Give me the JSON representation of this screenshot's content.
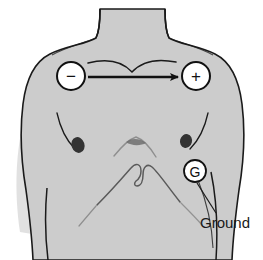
{
  "figure": {
    "background_color": "#ffffff",
    "body_fill_color": "#cccccc",
    "outline_color": "#1a1a1a",
    "nipple_color": "#333333"
  },
  "electrodes": [
    {
      "id": "negative-electrode",
      "glyph": "−",
      "semantic_name": "negative-electrode-marker",
      "position": "right infraclavicular / patient left upper chest",
      "cx": 71,
      "cy": 76,
      "r": 14
    },
    {
      "id": "positive-electrode",
      "glyph": "+",
      "semantic_name": "positive-electrode-marker",
      "position": "left infraclavicular / patient right upper chest",
      "cx": 196,
      "cy": 76,
      "r": 14
    },
    {
      "id": "ground-electrode",
      "glyph": "G",
      "semantic_name": "ground-electrode-marker",
      "position": "lower left chest near costal margin",
      "cx": 195,
      "cy": 171,
      "r": 11
    }
  ],
  "arrow": {
    "name": "vector-arrow",
    "description": "lead vector from negative to positive electrode",
    "x_start": 88,
    "x_end": 182,
    "y": 77,
    "color": "#111111"
  },
  "annotations": [
    {
      "id": "ground-label",
      "text": "Ground",
      "x": 200,
      "y": 225,
      "leader_from": [
        198,
        182
      ],
      "leader_to": [
        214,
        214
      ]
    }
  ],
  "anatomy": [
    {
      "name": "neck",
      "visible": true
    },
    {
      "name": "clavicle-line",
      "visible": true
    },
    {
      "name": "left-nipple",
      "visible": true
    },
    {
      "name": "right-nipple",
      "visible": true
    },
    {
      "name": "sternal-notch",
      "visible": true
    },
    {
      "name": "rib-cage-arch",
      "visible": true
    },
    {
      "name": "shoulder-left",
      "visible": true
    },
    {
      "name": "shoulder-right",
      "visible": true
    }
  ]
}
